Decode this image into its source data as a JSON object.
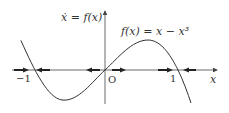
{
  "diagram": {
    "y_axis_label": "ẋ = f(x)",
    "x_axis_label": "x",
    "function_label": "f(x) = x − x³",
    "origin_label": "O",
    "tick_labels": {
      "neg_one": "−1",
      "one": "1"
    },
    "equilibria": [
      {
        "x": -1,
        "stability": "stable"
      },
      {
        "x": 0,
        "stability": "unstable"
      },
      {
        "x": 1,
        "stability": "stable"
      }
    ],
    "flow_arrows": [
      {
        "region": "x < -1",
        "direction": "right"
      },
      {
        "region": "-1 < x < 0 (near -1)",
        "direction": "left"
      },
      {
        "region": "-1 < x < 0 (near 0)",
        "direction": "left"
      },
      {
        "region": "0 < x < 1 (near 0)",
        "direction": "right"
      },
      {
        "region": "0 < x < 1 (near 1)",
        "direction": "right"
      },
      {
        "region": "x > 1",
        "direction": "left"
      }
    ],
    "colors": {
      "curve": "#333333",
      "axis": "#444444",
      "arrow": "#222222"
    }
  }
}
